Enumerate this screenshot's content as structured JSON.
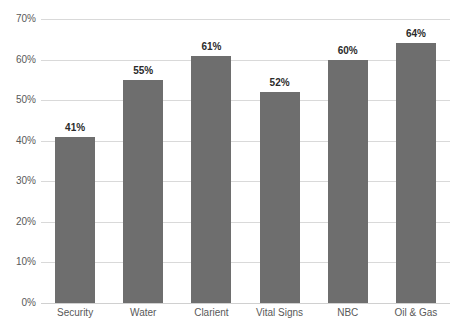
{
  "chart_data": {
    "type": "bar",
    "title": "",
    "xlabel": "",
    "ylabel": "",
    "categories": [
      "Security",
      "Water",
      "Clarient",
      "Vital Signs",
      "NBC",
      "Oil & Gas"
    ],
    "values": [
      41,
      55,
      61,
      52,
      60,
      64
    ],
    "value_labels": [
      "41%",
      "55%",
      "61%",
      "52%",
      "60%",
      "64%"
    ],
    "ylim": [
      0,
      70
    ],
    "ytick_values": [
      0,
      10,
      20,
      30,
      40,
      50,
      60,
      70
    ],
    "ytick_labels": [
      "0%",
      "10%",
      "20%",
      "30%",
      "40%",
      "50%",
      "60%",
      "70%"
    ],
    "grid": true,
    "legend": "none",
    "bar_color": "#6e6e6e",
    "gridline_color": "#d9d9d9",
    "axis_text_color": "#595959",
    "value_label_color": "#2b2b2b",
    "background_color": "#ffffff"
  }
}
